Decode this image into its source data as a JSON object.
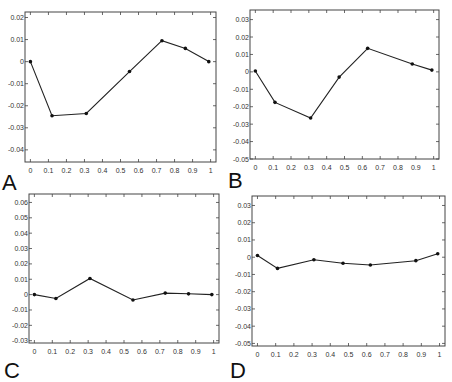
{
  "chart_data": [
    {
      "type": "line",
      "panel": "A",
      "title": "",
      "xlabel": "",
      "ylabel": "",
      "xlim": [
        -0.03,
        1.03
      ],
      "ylim": [
        -0.0455,
        0.0225
      ],
      "xticks": [
        0,
        0.1,
        0.2,
        0.3,
        0.4,
        0.5,
        0.6,
        0.7,
        0.8,
        0.9,
        1
      ],
      "xtick_labels": [
        "0",
        "0.1",
        "0.2",
        "0.3",
        "0.4",
        "0.5",
        "0.6",
        "0.7",
        "0.8",
        "0.9",
        "1"
      ],
      "yticks": [
        0.02,
        0.01,
        0,
        -0.01,
        -0.02,
        -0.03,
        -0.04
      ],
      "ytick_labels": [
        "0.02",
        "0.01",
        "0",
        "-0.01",
        "-0.02",
        "-0.03",
        "-0.04"
      ],
      "grid": false,
      "series": [
        {
          "name": "A",
          "x": [
            0.0,
            0.12,
            0.31,
            0.55,
            0.73,
            0.86,
            0.99
          ],
          "y": [
            0.0,
            -0.0245,
            -0.0235,
            -0.0045,
            0.0095,
            0.006,
            0.0
          ]
        }
      ],
      "box": {
        "left": 25,
        "top": 12,
        "right": 216,
        "bottom": 162
      }
    },
    {
      "type": "line",
      "panel": "B",
      "title": "",
      "xlabel": "",
      "ylabel": "",
      "xlim": [
        -0.03,
        1.03
      ],
      "ylim": [
        -0.05,
        0.0355
      ],
      "xticks": [
        0,
        0.1,
        0.2,
        0.3,
        0.4,
        0.5,
        0.6,
        0.7,
        0.8,
        0.9,
        1
      ],
      "xtick_labels": [
        "0",
        "0.1",
        "0.2",
        "0.3",
        "0.4",
        "0.5",
        "0.6",
        "0.7",
        "0.8",
        "0.9",
        "1"
      ],
      "yticks": [
        0.03,
        0.02,
        0.01,
        0,
        -0.01,
        -0.02,
        -0.03,
        -0.04,
        -0.05
      ],
      "ytick_labels": [
        "0.03",
        "0.02",
        "0.01",
        "0",
        "-0.01",
        "-0.02",
        "-0.03",
        "-0.04",
        "-0.05"
      ],
      "grid": false,
      "series": [
        {
          "name": "B",
          "x": [
            0.0,
            0.11,
            0.31,
            0.47,
            0.63,
            0.88,
            0.99
          ],
          "y": [
            0.0005,
            -0.0175,
            -0.0265,
            -0.003,
            0.0135,
            0.0045,
            0.001
          ]
        }
      ],
      "box": {
        "left": 250,
        "top": 10,
        "right": 439,
        "bottom": 159
      }
    },
    {
      "type": "line",
      "panel": "C",
      "title": "",
      "xlabel": "",
      "ylabel": "",
      "xlim": [
        -0.03,
        1.03
      ],
      "ylim": [
        -0.0315,
        0.0655
      ],
      "xticks": [
        0,
        0.1,
        0.2,
        0.3,
        0.4,
        0.5,
        0.6,
        0.7,
        0.8,
        0.9,
        1
      ],
      "xtick_labels": [
        "0",
        "0.1",
        "0.2",
        "0.3",
        "0.4",
        "0.5",
        "0.6",
        "0.7",
        "0.8",
        "0.9",
        "1"
      ],
      "yticks": [
        0.06,
        0.05,
        0.04,
        0.03,
        0.02,
        0.01,
        0,
        -0.01,
        -0.02,
        -0.03
      ],
      "ytick_labels": [
        "0.06",
        "0.05",
        "0.04",
        "0.03",
        "0.02",
        "0.01",
        "0",
        "-0.01",
        "-0.02",
        "-0.03"
      ],
      "grid": false,
      "series": [
        {
          "name": "C",
          "x": [
            0.0,
            0.12,
            0.31,
            0.55,
            0.73,
            0.86,
            0.99
          ],
          "y": [
            0.0,
            -0.0025,
            0.0105,
            -0.0035,
            0.001,
            0.0005,
            0.0
          ]
        }
      ],
      "box": {
        "left": 29,
        "top": 194,
        "right": 219,
        "bottom": 343
      }
    },
    {
      "type": "line",
      "panel": "D",
      "title": "",
      "xlabel": "",
      "ylabel": "",
      "xlim": [
        -0.03,
        1.03
      ],
      "ylim": [
        -0.0515,
        0.0355
      ],
      "xticks": [
        0,
        0.1,
        0.2,
        0.3,
        0.4,
        0.5,
        0.6,
        0.7,
        0.8,
        0.9,
        1
      ],
      "xtick_labels": [
        "0",
        "0.1",
        "0.2",
        "0.3",
        "0.4",
        "0.5",
        "0.6",
        "0.7",
        "0.8",
        "0.9",
        "1"
      ],
      "yticks": [
        0.03,
        0.02,
        0.01,
        0,
        -0.01,
        -0.02,
        -0.03,
        -0.04,
        -0.05
      ],
      "ytick_labels": [
        "0.03",
        "0.02",
        "0.01",
        "0",
        "-0.01",
        "-0.02",
        "-0.03",
        "-0.04",
        "-0.05"
      ],
      "grid": false,
      "series": [
        {
          "name": "D",
          "x": [
            0.0,
            0.11,
            0.31,
            0.47,
            0.62,
            0.87,
            0.99
          ],
          "y": [
            0.001,
            -0.0065,
            -0.0015,
            -0.0035,
            -0.0045,
            -0.002,
            0.002
          ]
        }
      ],
      "box": {
        "left": 252,
        "top": 196,
        "right": 445,
        "bottom": 346
      }
    }
  ],
  "panel_labels": [
    {
      "text": "A",
      "x": 2,
      "y": 190
    },
    {
      "text": "B",
      "x": 228,
      "y": 188
    },
    {
      "text": "C",
      "x": 4,
      "y": 378
    },
    {
      "text": "D",
      "x": 230,
      "y": 378
    }
  ],
  "colors": {
    "line": "#222222",
    "marker": "#111111",
    "axes": "#444444",
    "tick_text": "#333333",
    "background": "#ffffff"
  }
}
